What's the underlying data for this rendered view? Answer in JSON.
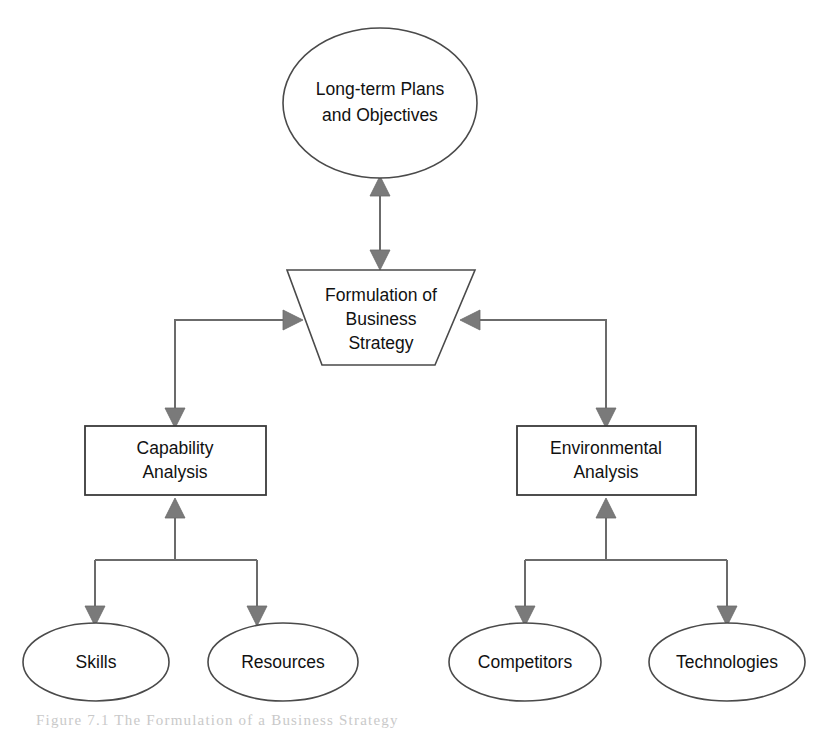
{
  "figure": {
    "caption": "Figure 7.1   The Formulation of a Business Strategy",
    "background_color": "#ffffff",
    "shape_stroke_color": "#4a4a4a",
    "connector_color": "#6b6b6b",
    "arrow_fill_color": "#7a7a7a",
    "label_color": "#111111"
  },
  "nodes": {
    "objectives": {
      "label_line1": "Long-term Plans",
      "label_line2": "and Objectives",
      "shape": "ellipse"
    },
    "formulation": {
      "label_line1": "Formulation of",
      "label_line2": "Business",
      "label_line3": "Strategy",
      "shape": "inverted-trapezoid"
    },
    "capability": {
      "label_line1": "Capability",
      "label_line2": "Analysis",
      "shape": "rectangle"
    },
    "environmental": {
      "label_line1": "Environmental",
      "label_line2": "Analysis",
      "shape": "rectangle"
    },
    "skills": {
      "label": "Skills",
      "shape": "ellipse"
    },
    "resources": {
      "label": "Resources",
      "shape": "ellipse"
    },
    "competitors": {
      "label": "Competitors",
      "shape": "ellipse"
    },
    "technologies": {
      "label": "Technologies",
      "shape": "ellipse"
    }
  },
  "edges": [
    {
      "from": "formulation",
      "to": "objectives",
      "style": "bidirectional-vertical"
    },
    {
      "from": "capability",
      "to": "formulation",
      "style": "elbow-right-arrow"
    },
    {
      "from": "environmental",
      "to": "formulation",
      "style": "elbow-left-arrow"
    },
    {
      "from": "formulation",
      "to": "capability",
      "style": "elbow-down-arrow"
    },
    {
      "from": "formulation",
      "to": "environmental",
      "style": "elbow-down-arrow"
    },
    {
      "from": "skills",
      "to": "capability",
      "style": "tee-up-arrow"
    },
    {
      "from": "resources",
      "to": "capability",
      "style": "tee-up-arrow"
    },
    {
      "from": "capability",
      "to": "skills",
      "style": "tee-down-arrow"
    },
    {
      "from": "capability",
      "to": "resources",
      "style": "tee-down-arrow"
    },
    {
      "from": "competitors",
      "to": "environmental",
      "style": "tee-up-arrow"
    },
    {
      "from": "technologies",
      "to": "environmental",
      "style": "tee-up-arrow"
    },
    {
      "from": "environmental",
      "to": "competitors",
      "style": "tee-down-arrow"
    },
    {
      "from": "environmental",
      "to": "technologies",
      "style": "tee-down-arrow"
    }
  ]
}
